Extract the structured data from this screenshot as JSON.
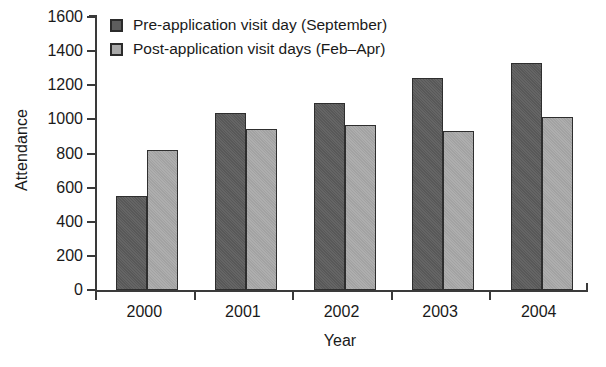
{
  "chart_data": {
    "type": "bar",
    "title": "",
    "xlabel": "Year",
    "ylabel": "Attendance",
    "categories": [
      "2000",
      "2001",
      "2002",
      "2003",
      "2004"
    ],
    "series": [
      {
        "name": "Pre-application visit day (September)",
        "color": "#5d5d5d",
        "values": [
          550,
          1040,
          1095,
          1240,
          1330
        ]
      },
      {
        "name": "Post-application visit days (Feb–Apr)",
        "color": "#a9a9a9",
        "values": [
          820,
          945,
          965,
          930,
          1015
        ]
      }
    ],
    "ylim": [
      0,
      1600
    ],
    "ytick_step": 200,
    "yticks": [
      0,
      200,
      400,
      600,
      800,
      1000,
      1200,
      1400,
      1600
    ],
    "ytick_labels": [
      "0",
      "200",
      "400",
      "600",
      "800",
      "1000",
      "1200",
      "1400",
      "1600"
    ],
    "grid": false,
    "legend_position": "top-left"
  },
  "axes": {
    "y_title": "Attendance",
    "x_title": "Year"
  },
  "legend": {
    "items": [
      {
        "label": "Pre-application visit day (September)",
        "swatch": "pre"
      },
      {
        "label": "Post-application visit days (Feb–Apr)",
        "swatch": "post"
      }
    ]
  }
}
